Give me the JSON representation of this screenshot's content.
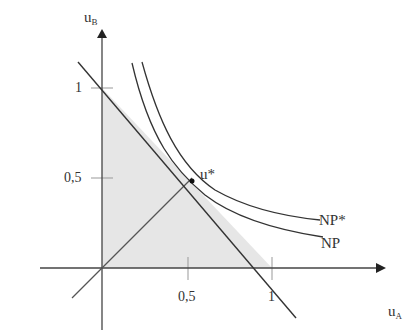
{
  "diagram": {
    "type": "utility-possibility-frontier",
    "axes": {
      "x": {
        "label": "u",
        "subscript": "A",
        "ticks": [
          "0,5",
          "1"
        ]
      },
      "y": {
        "label": "u",
        "subscript": "B",
        "ticks": [
          "1",
          "0,5"
        ]
      }
    },
    "point_label": "u*",
    "curves": [
      {
        "name": "NP*",
        "label": "NP*"
      },
      {
        "name": "NP",
        "label": "NP"
      }
    ],
    "colors": {
      "line": "#333333",
      "fill": "#e6e6e6",
      "grid": "#999999"
    }
  }
}
